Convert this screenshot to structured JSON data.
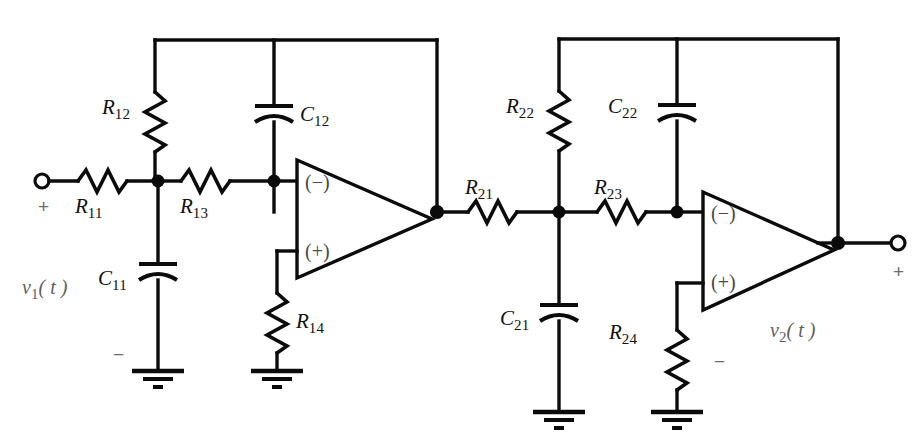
{
  "diagram": {
    "type": "schematic",
    "background_color": "#ffffff",
    "wire_color": "#0b0b0b"
  },
  "components": {
    "r11": {
      "label": "R",
      "sub": "11"
    },
    "r12": {
      "label": "R",
      "sub": "12"
    },
    "r13": {
      "label": "R",
      "sub": "13"
    },
    "r14": {
      "label": "R",
      "sub": "14"
    },
    "c11": {
      "label": "C",
      "sub": "11"
    },
    "c12": {
      "label": "C",
      "sub": "12"
    },
    "r21": {
      "label": "R",
      "sub": "21"
    },
    "r22": {
      "label": "R",
      "sub": "22"
    },
    "r23": {
      "label": "R",
      "sub": "23"
    },
    "r24": {
      "label": "R",
      "sub": "24"
    },
    "c21": {
      "label": "C",
      "sub": "21"
    },
    "c22": {
      "label": "C",
      "sub": "22"
    }
  },
  "opamps": {
    "a1": {
      "minus": "(−)",
      "plus": "(+)"
    },
    "a2": {
      "minus": "(−)",
      "plus": "(+)"
    }
  },
  "ports": {
    "input": {
      "signal": "v",
      "signal_sub": "1",
      "signal_arg": "( t )",
      "plus": "+",
      "minus": "−"
    },
    "output": {
      "signal": "v",
      "signal_sub": "2",
      "signal_arg": "( t )",
      "plus": "+",
      "minus": "−"
    }
  }
}
